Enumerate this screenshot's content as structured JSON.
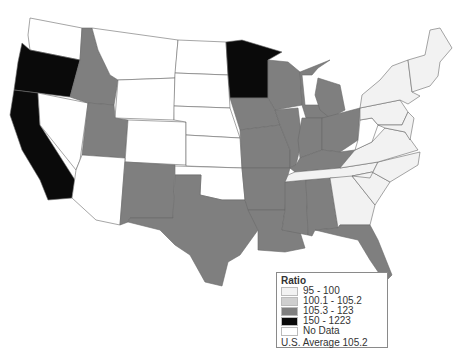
{
  "legend": {
    "title": "Ratio",
    "items": [
      {
        "label": "95 - 100",
        "color": "#f2f2f2"
      },
      {
        "label": "100.1 - 105.2",
        "color": "#cfcfcf"
      },
      {
        "label": "105.3 - 123",
        "color": "#7f7f7f"
      },
      {
        "label": "150 - 1223",
        "color": "#0a0a0a"
      },
      {
        "label": "No Data",
        "color": "#ffffff"
      }
    ],
    "note": "U.S. Average 105.2"
  },
  "states": [
    {
      "name": "WA",
      "class": "No Data"
    },
    {
      "name": "OR",
      "class": "150 - 1223"
    },
    {
      "name": "CA",
      "class": "150 - 1223"
    },
    {
      "name": "MN",
      "class": "150 - 1223"
    },
    {
      "name": "ID",
      "class": "105.3 - 123"
    },
    {
      "name": "UT",
      "class": "105.3 - 123"
    },
    {
      "name": "NM",
      "class": "105.3 - 123"
    },
    {
      "name": "TX",
      "class": "105.3 - 123"
    },
    {
      "name": "IA",
      "class": "105.3 - 123"
    },
    {
      "name": "MO",
      "class": "105.3 - 123"
    },
    {
      "name": "AR",
      "class": "105.3 - 123"
    },
    {
      "name": "LA",
      "class": "105.3 - 123"
    },
    {
      "name": "MS",
      "class": "105.3 - 123"
    },
    {
      "name": "AL",
      "class": "105.3 - 123"
    },
    {
      "name": "FL",
      "class": "105.3 - 123"
    },
    {
      "name": "WI",
      "class": "105.3 - 123"
    },
    {
      "name": "IL",
      "class": "105.3 - 123"
    },
    {
      "name": "MI",
      "class": "105.3 - 123"
    },
    {
      "name": "IN",
      "class": "105.3 - 123"
    },
    {
      "name": "OH",
      "class": "105.3 - 123"
    },
    {
      "name": "KY",
      "class": "105.3 - 123"
    },
    {
      "name": "TN",
      "class": "95 - 100"
    },
    {
      "name": "GA",
      "class": "95 - 100"
    },
    {
      "name": "SC",
      "class": "95 - 100"
    },
    {
      "name": "NC",
      "class": "95 - 100"
    },
    {
      "name": "VA",
      "class": "95 - 100"
    },
    {
      "name": "PA",
      "class": "95 - 100"
    },
    {
      "name": "NY",
      "class": "95 - 100"
    },
    {
      "name": "New England",
      "class": "95 - 100"
    },
    {
      "name": "WV",
      "class": "No Data"
    },
    {
      "name": "NV",
      "class": "No Data"
    },
    {
      "name": "AZ",
      "class": "No Data"
    },
    {
      "name": "MT",
      "class": "No Data"
    },
    {
      "name": "WY",
      "class": "No Data"
    },
    {
      "name": "CO",
      "class": "No Data"
    },
    {
      "name": "ND",
      "class": "No Data"
    },
    {
      "name": "SD",
      "class": "No Data"
    },
    {
      "name": "NE",
      "class": "No Data"
    },
    {
      "name": "KS",
      "class": "No Data"
    },
    {
      "name": "OK",
      "class": "No Data"
    }
  ]
}
